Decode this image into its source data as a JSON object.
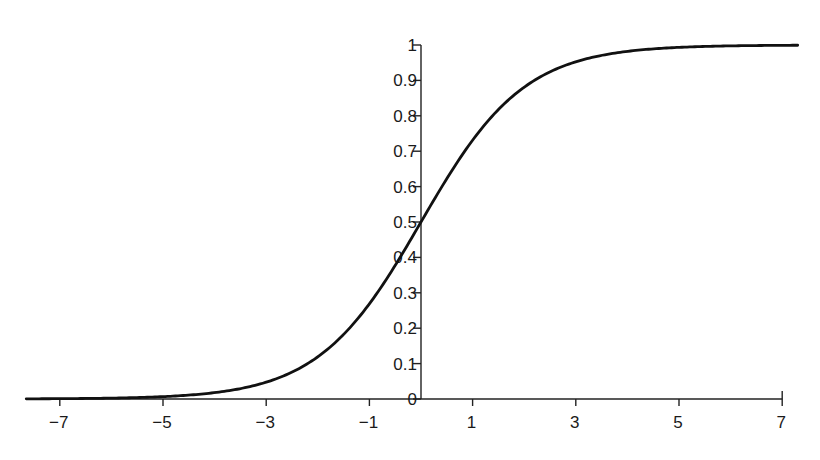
{
  "chart_data": {
    "type": "line",
    "title": "",
    "xlabel": "",
    "ylabel": "",
    "function": "logistic sigmoid 1/(1+e^-x)",
    "xlim": [
      -7.65,
      7.0
    ],
    "ylim": [
      0,
      1
    ],
    "x_ticks": [
      -7,
      -5,
      -3,
      -1,
      1,
      3,
      5,
      7
    ],
    "x_tick_labels": [
      "−7",
      "−5",
      "−3",
      "−1",
      "1",
      "3",
      "5",
      "7"
    ],
    "y_ticks": [
      0,
      0.1,
      0.2,
      0.3,
      0.4,
      0.5,
      0.6,
      0.7,
      0.8,
      0.9,
      1
    ],
    "y_tick_labels": [
      "0",
      "0.1",
      "0.2",
      "0.3",
      "0.4",
      "0.5",
      "0.6",
      "0.7",
      "0.8",
      "0.9",
      "1"
    ],
    "grid": false,
    "legend": "none",
    "series": [
      {
        "name": "sigmoid",
        "x": [
          -7.65,
          -7,
          -6,
          -5,
          -4,
          -3,
          -2.5,
          -2,
          -1.5,
          -1,
          -0.5,
          0,
          0.5,
          1,
          1.5,
          2,
          2.5,
          3,
          4,
          5,
          6,
          7,
          7.3
        ],
        "y": [
          0.0005,
          0.0009,
          0.0025,
          0.0067,
          0.018,
          0.047,
          0.076,
          0.119,
          0.182,
          0.269,
          0.378,
          0.5,
          0.622,
          0.731,
          0.818,
          0.881,
          0.924,
          0.953,
          0.982,
          0.993,
          0.998,
          0.999,
          0.9993
        ]
      }
    ],
    "colors": {
      "line": "#111111",
      "axis": "#222222"
    }
  }
}
